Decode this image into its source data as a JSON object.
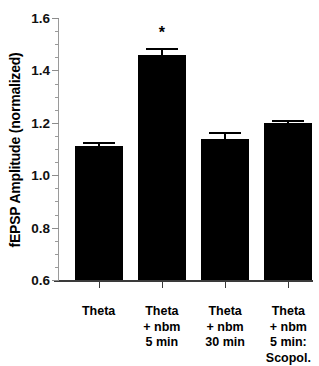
{
  "chart_data": {
    "type": "bar",
    "title": "",
    "subtitle": "",
    "xlabel": "",
    "ylabel": "fEPSP Amplitude (normalized)",
    "ylim": [
      0.6,
      1.6
    ],
    "ytick_labels": [
      "0.6",
      "0.8",
      "1.0",
      "1.2",
      "1.4",
      "1.6"
    ],
    "ytick_values": [
      0.6,
      0.8,
      1.0,
      1.2,
      1.4,
      1.6
    ],
    "yminor_step": 0.05,
    "grid": false,
    "legend": false,
    "legend_position": "none",
    "bar_color": "#000000",
    "categories": [
      "Theta",
      "Theta + nbm 5 min",
      "Theta + nbm 30 min",
      "Theta + nbm 5 min: Scopol."
    ],
    "category_lines": [
      [
        "Theta"
      ],
      [
        "Theta",
        "+ nbm",
        "5 min"
      ],
      [
        "Theta",
        "+ nbm",
        "30 min"
      ],
      [
        "Theta",
        "+ nbm",
        "5 min:",
        "Scopol."
      ]
    ],
    "values": [
      1.11,
      1.46,
      1.14,
      1.2
    ],
    "errors": [
      0.015,
      0.025,
      0.025,
      0.012
    ],
    "annotations": [
      {
        "category_index": 1,
        "text": "*",
        "meaning": "significant"
      }
    ]
  }
}
